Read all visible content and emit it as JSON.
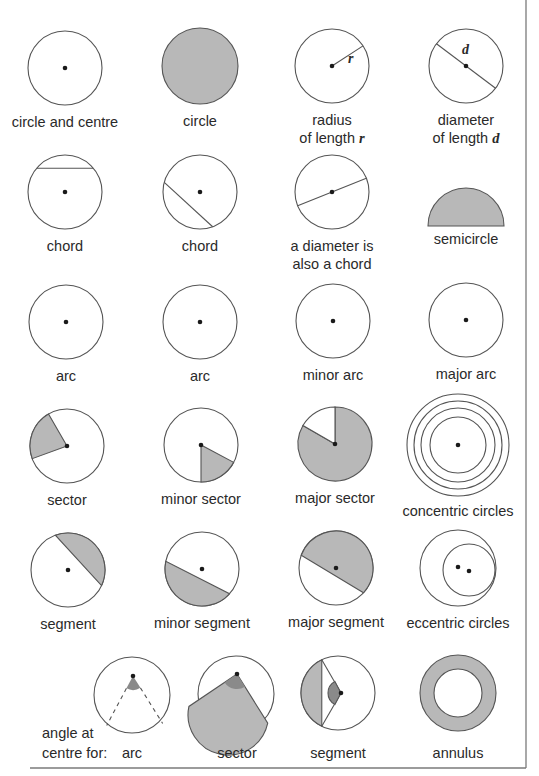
{
  "colors": {
    "stroke": "#555555",
    "fill_light": "#b8b8b8",
    "fill_dark": "#8a8a8a",
    "dot": "#1a1a1a",
    "text": "#2a2a2a",
    "border": "#7a7a7a"
  },
  "frame": {
    "right_x": 526,
    "bottom_y": 768,
    "left_x": 30
  },
  "figures": [
    {
      "id": "circle-and-centre",
      "type": "circle_centre",
      "cx": 65,
      "cy": 68,
      "r": 37,
      "labels": [
        "circle and centre"
      ]
    },
    {
      "id": "circle",
      "type": "filled_circle",
      "cx": 200,
      "cy": 66,
      "r": 38,
      "labels": [
        "circle"
      ]
    },
    {
      "id": "radius",
      "type": "radius",
      "cx": 332,
      "cy": 66,
      "r": 37,
      "symbol": "r",
      "labels": [
        "radius",
        "of length "
      ],
      "label_symbol": "r"
    },
    {
      "id": "diameter",
      "type": "diameter",
      "cx": 466,
      "cy": 66,
      "r": 37,
      "symbol": "d",
      "labels": [
        "diameter",
        "of length "
      ],
      "label_symbol": "d"
    },
    {
      "id": "chord-1",
      "type": "chord_h",
      "cx": 65,
      "cy": 192,
      "r": 37,
      "labels": [
        "chord"
      ]
    },
    {
      "id": "chord-2",
      "type": "chord_diag",
      "cx": 200,
      "cy": 192,
      "r": 37,
      "labels": [
        "chord"
      ]
    },
    {
      "id": "diameter-chord",
      "type": "diameter_chord",
      "cx": 332,
      "cy": 192,
      "r": 37,
      "labels": [
        "a diameter is",
        "also a chord"
      ]
    },
    {
      "id": "semicircle",
      "type": "semicircle",
      "cx": 466,
      "cy": 226,
      "r": 38,
      "labels": [
        "semicircle"
      ]
    },
    {
      "id": "arc-1",
      "type": "circle_centre",
      "cx": 66,
      "cy": 322,
      "r": 37,
      "labels": [
        "arc"
      ]
    },
    {
      "id": "arc-2",
      "type": "circle_centre",
      "cx": 200,
      "cy": 322,
      "r": 37,
      "labels": [
        "arc"
      ]
    },
    {
      "id": "minor-arc",
      "type": "circle_centre",
      "cx": 333,
      "cy": 321,
      "r": 37,
      "labels": [
        "minor arc"
      ]
    },
    {
      "id": "major-arc",
      "type": "circle_centre",
      "cx": 466,
      "cy": 320,
      "r": 37,
      "labels": [
        "major arc"
      ]
    },
    {
      "id": "sector",
      "type": "sector",
      "cx": 67,
      "cy": 446,
      "r": 37,
      "a1": 200,
      "a2": 300,
      "labels": [
        "sector"
      ]
    },
    {
      "id": "minor-sector",
      "type": "sector",
      "cx": 201,
      "cy": 445,
      "r": 37,
      "a1": 90,
      "a2": 25,
      "labels": [
        "minor sector"
      ]
    },
    {
      "id": "major-sector",
      "type": "major_sector",
      "cx": 335,
      "cy": 444,
      "r": 37,
      "labels": [
        "major sector"
      ]
    },
    {
      "id": "concentric-circles",
      "type": "concentric",
      "cx": 458,
      "cy": 445,
      "radii": [
        28,
        37,
        44,
        51
      ],
      "labels": [
        "concentric circles"
      ]
    },
    {
      "id": "segment",
      "type": "segment_small",
      "cx": 68,
      "cy": 570,
      "r": 37,
      "labels": [
        "segment"
      ]
    },
    {
      "id": "minor-segment",
      "type": "segment_minor",
      "cx": 202,
      "cy": 569,
      "r": 37,
      "labels": [
        "minor segment"
      ]
    },
    {
      "id": "major-segment",
      "type": "segment_major",
      "cx": 336,
      "cy": 568,
      "r": 37,
      "labels": [
        "major segment"
      ]
    },
    {
      "id": "eccentric-circles",
      "type": "eccentric",
      "cx": 458,
      "cy": 568,
      "r": 38,
      "labels": [
        "eccentric circles"
      ]
    },
    {
      "id": "angle-arc",
      "type": "angle_arc",
      "cx": 132,
      "cy": 695,
      "r": 38,
      "labels": [
        "arc"
      ]
    },
    {
      "id": "angle-sector",
      "type": "angle_sector",
      "cx": 236,
      "cy": 694,
      "r": 38,
      "labels": [
        "sector"
      ]
    },
    {
      "id": "angle-segment",
      "type": "angle_segment",
      "cx": 338,
      "cy": 693,
      "r": 37,
      "labels": [
        "segment"
      ]
    },
    {
      "id": "annulus",
      "type": "annulus",
      "cx": 458,
      "cy": 693,
      "r": 38,
      "r_inner": 24,
      "labels": [
        "annulus"
      ]
    }
  ],
  "side_label": {
    "lines": [
      "angle at",
      "centre for:"
    ],
    "x": 42,
    "y1": 738,
    "y2": 758
  }
}
